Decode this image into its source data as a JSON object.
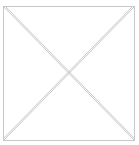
{
  "placeholder": {
    "kind": "image-placeholder",
    "icon": "crossed-box-icon",
    "stroke_color": "#c8c8c8",
    "background": "#ffffff"
  }
}
